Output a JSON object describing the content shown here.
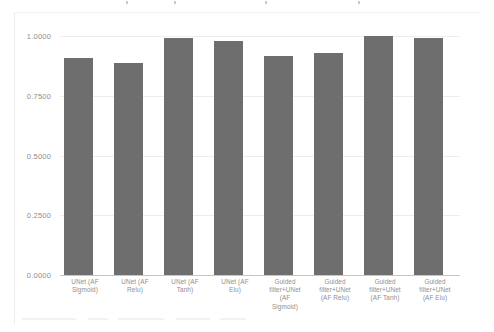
{
  "chart": {
    "type": "bar",
    "title": "",
    "xlabel": "",
    "ylabel": ""
  },
  "chart_data": {
    "type": "bar",
    "title": "",
    "xlabel": "",
    "ylabel": "",
    "ylim": [
      0.0,
      1.0
    ],
    "grid": true,
    "legend": "none",
    "bar_color": "#6e6e6e",
    "ytick_labels": [
      "1.0000",
      "0.7500",
      "0.5000",
      "0.2500",
      "0.0000"
    ],
    "ytick_values": [
      1.0,
      0.75,
      0.5,
      0.25,
      0.0
    ],
    "categories": [
      "UNet (AF Sigmoid)",
      "UNet (AF Relu)",
      "UNet (AF Tanh)",
      "UNet (AF Elu)",
      "Guided filter+UNet (AF Sigmoid)",
      "Guided filter+UNet (AF Relu)",
      "Guided filter+UNet (AF Tanh)",
      "Guided filter+UNet (AF Elu)"
    ],
    "category_lines": [
      [
        "UNet (AF",
        "Sigmoid)"
      ],
      [
        "UNet (AF",
        "Relu)"
      ],
      [
        "UNet (AF",
        "Tanh)"
      ],
      [
        "UNet (AF",
        "Elu)"
      ],
      [
        "Guided",
        "filter+UNet",
        "(AF",
        "Sigmoid)"
      ],
      [
        "Guided",
        "filter+UNet",
        "(AF Relu)"
      ],
      [
        "Guided",
        "filter+UNet",
        "(AF Tanh)"
      ],
      [
        "Guided",
        "filter+UNet",
        "(AF Elu)"
      ]
    ],
    "values": [
      0.908,
      0.887,
      0.992,
      0.979,
      0.916,
      0.929,
      1.0,
      0.992
    ]
  }
}
